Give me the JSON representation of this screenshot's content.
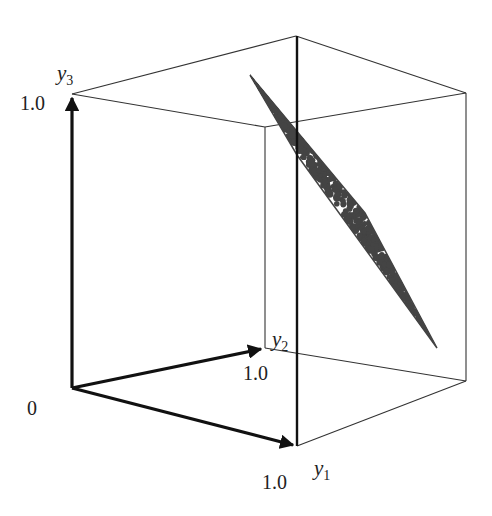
{
  "diagram": {
    "type": "3d-unit-cube-with-scatter-plane",
    "axes": [
      {
        "id": "y1",
        "name": "y",
        "subscript": "1",
        "tick_label": "1.0"
      },
      {
        "id": "y2",
        "name": "y",
        "subscript": "2",
        "tick_label": "1.0"
      },
      {
        "id": "y3",
        "name": "y",
        "subscript": "3",
        "tick_label": "1.0"
      }
    ],
    "origin_label": "0",
    "colors": {
      "axis": "#111111",
      "box_edge": "#333333",
      "plane_fill": "#ffffff",
      "plane_edge": "#444444",
      "scatter_points": "#444444"
    },
    "plane_description": "Thin tilted planar region inside the unit cube filled with dense scatter points"
  }
}
